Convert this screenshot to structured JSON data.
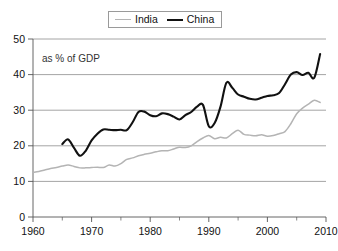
{
  "legend": {
    "position": "top-center",
    "entries": [
      {
        "label": "India",
        "color": "#b4b4b4",
        "icon": "line-swatch-icon"
      },
      {
        "label": "China",
        "color": "#111111",
        "icon": "line-swatch-icon"
      }
    ]
  },
  "annotation": {
    "text": "as % of GDP"
  },
  "axes": {
    "y_ticks": [
      "0",
      "10",
      "20",
      "30",
      "40",
      "50"
    ],
    "x_ticks": [
      "1960",
      "1970",
      "1980",
      "1990",
      "2000",
      "2010"
    ]
  },
  "chart_data": {
    "type": "line",
    "title": "",
    "subtitle": "",
    "xlabel": "",
    "ylabel": "",
    "annotation": "as % of GDP",
    "xlim": [
      1960,
      2010
    ],
    "ylim": [
      0,
      50
    ],
    "ytick_step": 10,
    "xtick_step": 10,
    "x_minor_tick_step": 5,
    "grid": "horizontal",
    "legend_position": "top-center",
    "series": [
      {
        "name": "India",
        "color": "#b4b4b4",
        "x": [
          1960,
          1961,
          1962,
          1963,
          1964,
          1965,
          1966,
          1967,
          1968,
          1969,
          1970,
          1971,
          1972,
          1973,
          1974,
          1975,
          1976,
          1977,
          1978,
          1979,
          1980,
          1981,
          1982,
          1983,
          1984,
          1985,
          1986,
          1987,
          1988,
          1989,
          1990,
          1991,
          1992,
          1993,
          1994,
          1995,
          1996,
          1997,
          1998,
          1999,
          2000,
          2001,
          2002,
          2003,
          2004,
          2005,
          2006,
          2007,
          2008,
          2009
        ],
        "values": [
          12.5,
          12.8,
          13.2,
          13.6,
          13.9,
          14.3,
          14.6,
          14.2,
          13.8,
          13.8,
          13.9,
          14.0,
          13.9,
          14.6,
          14.3,
          15.0,
          16.2,
          16.6,
          17.2,
          17.6,
          17.9,
          18.3,
          18.6,
          18.6,
          19.1,
          19.6,
          19.5,
          20.0,
          21.2,
          22.2,
          22.9,
          22.0,
          22.4,
          22.2,
          23.4,
          24.4,
          23.2,
          23.0,
          22.8,
          23.1,
          22.7,
          22.9,
          23.4,
          24.0,
          26.2,
          29.0,
          30.6,
          31.7,
          32.8,
          32.2
        ]
      },
      {
        "name": "China",
        "color": "#111111",
        "x": [
          1965,
          1966,
          1967,
          1968,
          1969,
          1970,
          1971,
          1972,
          1973,
          1974,
          1975,
          1976,
          1977,
          1978,
          1979,
          1980,
          1981,
          1982,
          1983,
          1984,
          1985,
          1986,
          1987,
          1988,
          1989,
          1990,
          1991,
          1992,
          1993,
          1994,
          1995,
          1996,
          1997,
          1998,
          1999,
          2000,
          2001,
          2002,
          2003,
          2004,
          2005,
          2006,
          2007,
          2008,
          2009
        ],
        "values": [
          20.5,
          21.8,
          19.4,
          17.2,
          18.6,
          21.5,
          23.4,
          24.6,
          24.5,
          24.4,
          24.5,
          24.4,
          26.6,
          29.5,
          29.6,
          28.6,
          28.3,
          29.1,
          28.9,
          28.2,
          27.4,
          28.6,
          29.5,
          31.0,
          31.5,
          25.5,
          26.4,
          31.0,
          37.7,
          36.3,
          34.4,
          33.8,
          33.2,
          33.0,
          33.5,
          34.0,
          34.2,
          34.8,
          37.3,
          40.0,
          40.7,
          39.9,
          40.5,
          39.1,
          45.8
        ]
      }
    ]
  }
}
